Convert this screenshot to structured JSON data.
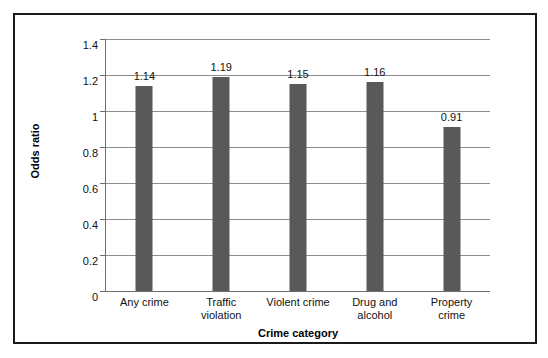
{
  "chart_data": {
    "type": "bar",
    "title": "",
    "subtitle": "",
    "xlabel": "Crime category",
    "ylabel": "Odds ratio",
    "categories": [
      "Any crime",
      "Traffic violation",
      "Violent crime",
      "Drug and alcohol",
      "Property crime"
    ],
    "category_lines": [
      [
        "Any crime"
      ],
      [
        "Traffic",
        "violation"
      ],
      [
        "Violent crime"
      ],
      [
        "Drug and",
        "alcohol"
      ],
      [
        "Property",
        "crime"
      ]
    ],
    "values": [
      1.14,
      1.19,
      1.15,
      1.16,
      0.91
    ],
    "value_labels": [
      "1.14",
      "1.19",
      "1.15",
      "1.16",
      "0.91"
    ],
    "ylim": [
      0,
      1.4
    ],
    "yticks": [
      0,
      0.2,
      0.4,
      0.6,
      0.8,
      1.0,
      1.2,
      1.4
    ],
    "ytick_labels": [
      "0",
      "0.2",
      "0.4",
      "0.6",
      "0.8",
      "1",
      "1.2",
      "1.4"
    ],
    "grid": true,
    "legend": false,
    "legend_position": "none",
    "bar_color": "#595959",
    "gridline_color": "#8c8c8c",
    "axis_color": "#6e6e6e",
    "text_color": "#111111",
    "frame_color": "#1a1a1a",
    "background_color": "#ffffff"
  }
}
